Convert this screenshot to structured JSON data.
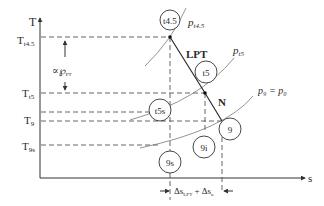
{
  "axes": {
    "y_label": "T",
    "x_label": "s"
  },
  "temperature_levels": {
    "Tt45": {
      "main": "T",
      "sub": "t4.5"
    },
    "Tt5": {
      "main": "T",
      "sub": "t5"
    },
    "T9": {
      "main": "T",
      "sub": "9"
    },
    "T9s": {
      "main": "T",
      "sub": "9s"
    }
  },
  "annotation_proportional": {
    "main": "∝℘",
    "sub": "PT"
  },
  "isobars": {
    "pt45": {
      "main": "p",
      "sub": "t4.5"
    },
    "pt5": {
      "main": "p",
      "sub": "t5"
    },
    "p9": {
      "text": "p₉ = p₀"
    }
  },
  "states": {
    "t45": "t4.5",
    "t5": "t5",
    "t5s": "t5s",
    "s9": "9",
    "s9i": "9i",
    "s9s": "9s"
  },
  "process_labels": {
    "lpt": "LPT",
    "nozzle": "N"
  },
  "entropy_change": {
    "text": "Δs",
    "sub1": "LPT",
    "plus": " + Δs",
    "sub2": "n"
  }
}
